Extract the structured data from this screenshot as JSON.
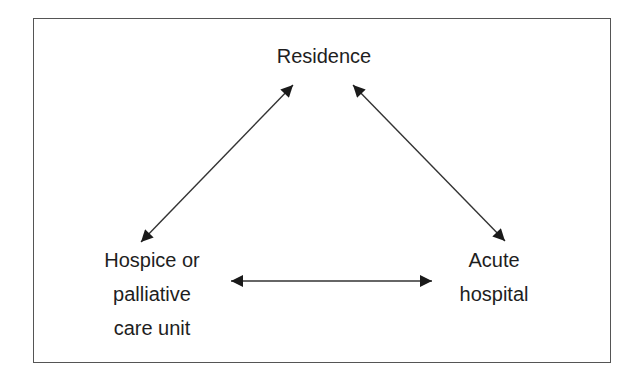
{
  "diagram": {
    "type": "flow",
    "nodes": [
      {
        "id": "residence",
        "label_lines": [
          "Residence"
        ]
      },
      {
        "id": "hospice",
        "label_lines": [
          "Hospice or",
          "palliative",
          "care unit"
        ]
      },
      {
        "id": "acute",
        "label_lines": [
          "Acute",
          "hospital"
        ]
      }
    ],
    "edges": [
      {
        "from": "residence",
        "to": "hospice",
        "direction": "bidirectional"
      },
      {
        "from": "residence",
        "to": "acute",
        "direction": "bidirectional"
      },
      {
        "from": "hospice",
        "to": "acute",
        "direction": "bidirectional"
      }
    ],
    "colors": {
      "line": "#333333",
      "text": "#1e1e1e",
      "border": "#555555",
      "background": "#ffffff"
    }
  }
}
